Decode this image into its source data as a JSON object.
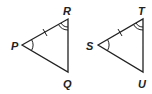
{
  "diagram": {
    "type": "congruent-triangles",
    "triangles": [
      {
        "name": "triangle-PQR",
        "vertices": {
          "P": "P",
          "R": "R",
          "Q": "Q"
        },
        "marks": {
          "side_PR": "single tick",
          "angle_P": "single arc",
          "angle_R": "double arc"
        }
      },
      {
        "name": "triangle-SUT",
        "vertices": {
          "S": "S",
          "T": "T",
          "U": "U"
        },
        "marks": {
          "side_ST": "single tick",
          "angle_S": "single arc",
          "angle_T": "double arc"
        }
      }
    ]
  },
  "labels": {
    "P": "P",
    "R": "R",
    "Q": "Q",
    "S": "S",
    "T": "T",
    "U": "U"
  },
  "colors": {
    "stroke": "#222222",
    "background": "#ffffff"
  }
}
